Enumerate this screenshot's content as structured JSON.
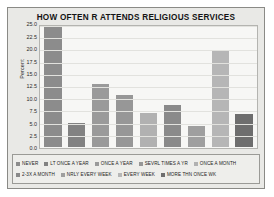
{
  "figure": {
    "background_color": "#e9e9e6",
    "plot_background_color": "#f7f7f5",
    "border_color": "#8a8a86"
  },
  "chart_data": {
    "type": "bar",
    "title": "HOW OFTEN R ATTENDS RELIGIOUS SERVICES",
    "xlabel": "",
    "ylabel": "Percent",
    "ylim": [
      0,
      25
    ],
    "yticks": [
      "0.0",
      "2.5",
      "5.0",
      "7.5",
      "10.0",
      "12.5",
      "15.0",
      "17.5",
      "20.0",
      "22.5",
      "25.0"
    ],
    "grid": true,
    "legend_position": "bottom",
    "categories": [
      "NEVER",
      "LT ONCE A YEAR",
      "ONCE A YEAR",
      "SEVRL TIMES A YR",
      "ONCE A MONTH",
      "2-3X A MONTH",
      "NRLY EVERY WEEK",
      "EVERY WEEK",
      "MORE THN ONCE WK"
    ],
    "values": [
      25.0,
      5.0,
      13.2,
      10.8,
      7.0,
      8.8,
      4.3,
      19.9,
      6.9
    ],
    "colors": [
      "#8c8c8c",
      "#828282",
      "#9a9a9a",
      "#979797",
      "#b1b1b1",
      "#8a8a8a",
      "#9f9f9f",
      "#b6b6b6",
      "#6e6e6e"
    ]
  },
  "legend": {
    "row1": [
      {
        "label": "NEVER",
        "color": "#8c8c8c"
      },
      {
        "label": "LT ONCE A YEAR",
        "color": "#828282"
      },
      {
        "label": "ONCE A YEAR",
        "color": "#9a9a9a"
      },
      {
        "label": "SEVRL TIMES A YR",
        "color": "#979797"
      },
      {
        "label": "ONCE A MONTH",
        "color": "#b1b1b1"
      }
    ],
    "row2": [
      {
        "label": "2-3X A MONTH",
        "color": "#8a8a8a"
      },
      {
        "label": "NRLY EVERY WEEK",
        "color": "#9f9f9f"
      },
      {
        "label": "EVERY WEEK",
        "color": "#b6b6b6"
      },
      {
        "label": "MORE THN ONCE WK",
        "color": "#6e6e6e"
      }
    ]
  }
}
